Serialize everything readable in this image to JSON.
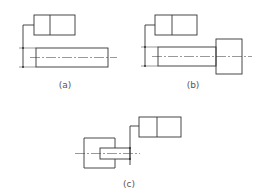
{
  "figure": {
    "panels": [
      {
        "id": "a",
        "caption": "(a)",
        "description": "Straight cylinder with feature control frame and leader to dimension"
      },
      {
        "id": "b",
        "caption": "(b)",
        "description": "Stepped shaft with head, feature control frame leader to shaft dimension"
      },
      {
        "id": "c",
        "caption": "(c)",
        "description": "Shaft inserted in hole/housing with feature control frame leader"
      }
    ]
  }
}
